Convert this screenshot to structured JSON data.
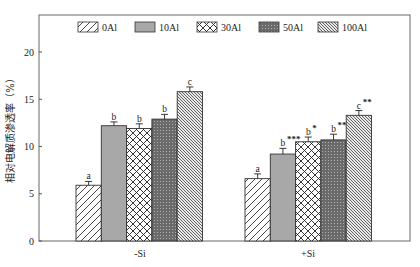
{
  "chart_data": {
    "type": "bar",
    "title": "",
    "xlabel": "",
    "ylabel": "相对电解质渗透率（%）",
    "ylim": [
      0,
      23
    ],
    "yticks": [
      0,
      5,
      10,
      15,
      20
    ],
    "grid": false,
    "legend_position": "top-inside",
    "categories": [
      "-Si",
      "+Si"
    ],
    "series": [
      {
        "name": "0Al",
        "pattern": "diagonal-hatch",
        "values": [
          5.9,
          6.6
        ],
        "errors": [
          0.4,
          0.5
        ],
        "letters": [
          "a",
          "a"
        ],
        "stars": [
          "",
          ""
        ]
      },
      {
        "name": "10Al",
        "pattern": "solid-gray",
        "values": [
          12.2,
          9.2
        ],
        "errors": [
          0.4,
          0.6
        ],
        "letters": [
          "b",
          "b"
        ],
        "stars": [
          "",
          "***"
        ]
      },
      {
        "name": "30Al",
        "pattern": "crosshatch",
        "values": [
          11.9,
          10.5
        ],
        "errors": [
          0.5,
          0.5
        ],
        "letters": [
          "b",
          "b"
        ],
        "stars": [
          "",
          "*"
        ]
      },
      {
        "name": "50Al",
        "pattern": "dotted-dark",
        "values": [
          12.9,
          10.7
        ],
        "errors": [
          0.5,
          0.6
        ],
        "letters": [
          "b",
          "b"
        ],
        "stars": [
          "",
          "**"
        ]
      },
      {
        "name": "100Al",
        "pattern": "dense-backslash",
        "values": [
          15.8,
          13.3
        ],
        "errors": [
          0.5,
          0.5
        ],
        "letters": [
          "c",
          "c"
        ],
        "stars": [
          "",
          "**"
        ]
      }
    ]
  },
  "colors": {
    "axis": "#555555",
    "solid_gray": "#a8a8a8",
    "dotted_dark": "#6a6a6a",
    "ink": "#222222"
  }
}
